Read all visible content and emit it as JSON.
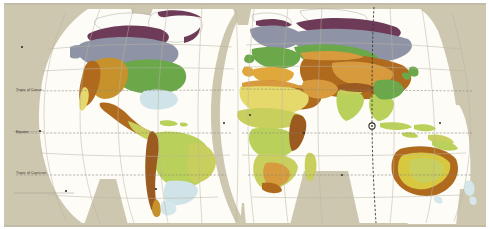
{
  "figure": {
    "projection": "interrupted-goode-homolosine",
    "background_color": "#cdc7b0",
    "ocean_color": "#fdfcf7",
    "graticule_color": "#b9b2a0",
    "page_border_color": "#ffffff"
  },
  "reference_lines": {
    "tropic_of_cancer": "Tropic of Cancer",
    "equator": "Equator",
    "tropic_of_capricorn": "Tropic of Capricorn",
    "dashed_color": "#8c8778",
    "meridian_color": "#3b3a32",
    "marker_label": "·"
  },
  "legend_colors": {
    "ice_cap": "#fbfbf8",
    "tundra": "#6d3a57",
    "subarctic_taiga": "#8f93a6",
    "humid_continental": "#6aa84a",
    "temperate_grassland": "#c7922c",
    "arid_desert": "#b06a1e",
    "semiarid_steppe": "#d79a3c",
    "mediterranean": "#e0a83a",
    "hot_desert": "#e4d96a",
    "tropical_savanna": "#c9cf5c",
    "tropical_wet": "#b9d15a",
    "humid_subtropical": "#cfe3e8",
    "highland": "#9a5a20",
    "marine_west_coast": "#d5e7ea"
  },
  "regions": [
    {
      "name": "Greenland ice cap",
      "climate": "ice_cap"
    },
    {
      "name": "Arctic tundra belt",
      "climate": "tundra"
    },
    {
      "name": "Canadian and Siberian taiga",
      "climate": "subarctic_taiga"
    },
    {
      "name": "Eastern North America",
      "climate": "humid_continental"
    },
    {
      "name": "Great Plains",
      "climate": "temperate_grassland"
    },
    {
      "name": "Southwest North America",
      "climate": "arid_desert"
    },
    {
      "name": "Southeast United States",
      "climate": "humid_subtropical"
    },
    {
      "name": "Amazon basin",
      "climate": "tropical_wet"
    },
    {
      "name": "Andes",
      "climate": "highland"
    },
    {
      "name": "Patagonia",
      "climate": "marine_west_coast"
    },
    {
      "name": "Sahara",
      "climate": "hot_desert"
    },
    {
      "name": "Sahel",
      "climate": "tropical_savanna"
    },
    {
      "name": "Congo basin",
      "climate": "tropical_wet"
    },
    {
      "name": "Southern Africa",
      "climate": "tropical_savanna"
    },
    {
      "name": "Europe",
      "climate": "humid_continental"
    },
    {
      "name": "Mediterranean",
      "climate": "mediterranean"
    },
    {
      "name": "Central Asia",
      "climate": "arid_desert"
    },
    {
      "name": "Arabian Peninsula",
      "climate": "arid_desert"
    },
    {
      "name": "India and Southeast Asia",
      "climate": "tropical_wet"
    },
    {
      "name": "Indonesia",
      "climate": "tropical_wet"
    },
    {
      "name": "Australian interior",
      "climate": "semiarid_steppe"
    },
    {
      "name": "Australian coast",
      "climate": "arid_desert"
    },
    {
      "name": "New Zealand",
      "climate": "marine_west_coast"
    }
  ]
}
